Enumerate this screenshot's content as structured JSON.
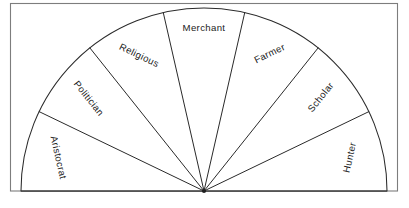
{
  "figure": {
    "title": "",
    "type": "semicircular-fan-diagram",
    "background_color": "#ffffff",
    "frame_color": "#7d7d7d",
    "stroke_color": "#2a2a2a",
    "label_color": "#1b1b1b"
  },
  "chart_data": {
    "type": "pie",
    "title": "",
    "subtitle": "",
    "xlabel": "",
    "ylabel": "",
    "grid": false,
    "legend": "none",
    "shape": "half-circle",
    "total_angle_degrees": 180,
    "start_angle_degrees": 180,
    "end_angle_degrees": 0,
    "center_x": 204,
    "center_y": 191,
    "radius": 183,
    "categories": [
      "Aristocrat",
      "Politician",
      "Religious",
      "Merchant",
      "Farmer",
      "Scholar",
      "Hunter"
    ],
    "values": [
      1,
      1,
      1,
      1,
      1,
      1,
      1
    ],
    "slice_angles_degrees": [
      25.71,
      25.71,
      25.71,
      25.71,
      25.71,
      25.71,
      25.71
    ],
    "annotations": []
  },
  "sectors": [
    {
      "label": "Aristocrat",
      "index": 0,
      "start_deg": 180,
      "end_deg": 154.29,
      "mid_deg": 167.14,
      "label_radius": 150,
      "label_rotation_deg": 77.14,
      "orientation": "radial"
    },
    {
      "label": "Politician",
      "index": 1,
      "start_deg": 154.29,
      "end_deg": 128.57,
      "mid_deg": 141.43,
      "label_radius": 148,
      "label_rotation_deg": 51.43,
      "orientation": "radial"
    },
    {
      "label": "Religious",
      "index": 2,
      "start_deg": 128.57,
      "end_deg": 102.86,
      "mid_deg": 115.71,
      "label_radius": 150,
      "label_rotation_deg": 25.71,
      "orientation": "radial"
    },
    {
      "label": "Merchant",
      "index": 3,
      "start_deg": 102.86,
      "end_deg": 77.14,
      "mid_deg": 90,
      "label_radius": 163,
      "label_rotation_deg": 0,
      "orientation": "horizontal"
    },
    {
      "label": "Farmer",
      "index": 4,
      "start_deg": 77.14,
      "end_deg": 51.43,
      "mid_deg": 64.29,
      "label_radius": 152,
      "label_rotation_deg": -25.71,
      "orientation": "radial"
    },
    {
      "label": "Scholar",
      "index": 5,
      "start_deg": 51.43,
      "end_deg": 25.71,
      "mid_deg": 38.57,
      "label_radius": 150,
      "label_rotation_deg": -51.43,
      "orientation": "radial"
    },
    {
      "label": "Hunter",
      "index": 6,
      "start_deg": 25.71,
      "end_deg": 0,
      "mid_deg": 12.86,
      "label_radius": 150,
      "label_rotation_deg": -77.14,
      "orientation": "radial"
    }
  ]
}
